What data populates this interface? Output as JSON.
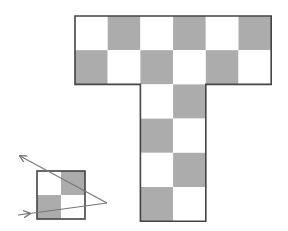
{
  "diagram": {
    "colors": {
      "background": "#ffffff",
      "light_cell": "#ffffff",
      "dark_cell": "#acacac",
      "border": "#444444",
      "arrow": "#777777"
    },
    "t_shape": {
      "origin": [
        75,
        16
      ],
      "cell_w": 32.7,
      "cell_h": 34.2,
      "rows": [
        {
          "cells": [
            "W",
            "G",
            "W",
            "G",
            "W",
            "G"
          ],
          "col_start": 0
        },
        {
          "cells": [
            "G",
            "W",
            "G",
            "W",
            "G",
            "W"
          ],
          "col_start": 0
        },
        {
          "cells": [
            "W",
            "G"
          ],
          "col_start": 2
        },
        {
          "cells": [
            "G",
            "W"
          ],
          "col_start": 2
        },
        {
          "cells": [
            "W",
            "G"
          ],
          "col_start": 2
        },
        {
          "cells": [
            "G",
            "W"
          ],
          "col_start": 2
        }
      ]
    },
    "small_square": {
      "origin": [
        37,
        171
      ],
      "size": 48,
      "cells": [
        [
          "W",
          "G"
        ],
        [
          "G",
          "W"
        ]
      ]
    },
    "arrows": {
      "path": [
        [
          18,
          215
        ],
        [
          107,
          203
        ],
        [
          20,
          156
        ]
      ]
    }
  }
}
